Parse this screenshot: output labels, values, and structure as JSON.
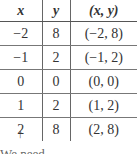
{
  "table": {
    "headers": [
      "x",
      "y",
      "(x, y)"
    ],
    "rows": [
      [
        "−2",
        "8",
        "(−2, 8)"
      ],
      [
        "−1",
        "2",
        "(−1, 2)"
      ],
      [
        "0",
        "0",
        "(0, 0)"
      ],
      [
        "1",
        "2",
        "(1, 2)"
      ],
      [
        "2",
        "8",
        "(2, 8)"
      ]
    ]
  },
  "annotation": {
    "arrow": "↑",
    "caption": "We need"
  }
}
